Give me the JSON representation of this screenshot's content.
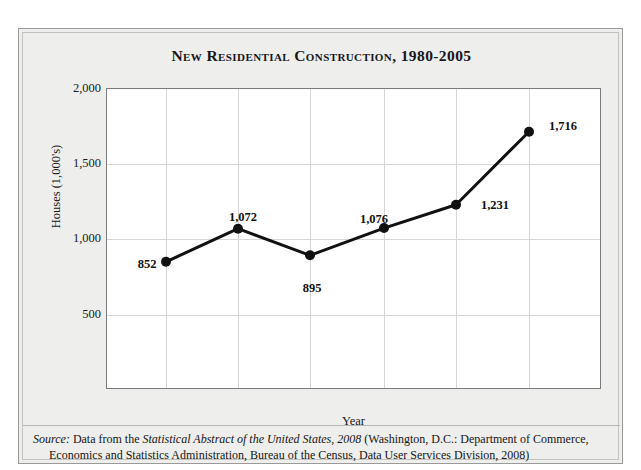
{
  "top_strip": {
    "ghost_text": "· · ·   · ·"
  },
  "figure": {
    "title": "New Residential Construction, 1980-2005",
    "source": {
      "label": "Source:",
      "text_before_italic": " Data from the ",
      "italic_work": "Statistical Abstract of the United States, 2008",
      "text_after_italic": " (Washington, D.C.: Department of Commerce,",
      "line2": "Economics and Statistics Administration, Bureau of the Census, Data User Services Division, 2008)"
    }
  },
  "chart_data": {
    "type": "line",
    "title": "New Residential Construction, 1980-2005",
    "xlabel": "Year",
    "ylabel": "Houses (1,000's)",
    "categories": [
      "1980",
      "1985",
      "1990",
      "1995",
      "2000",
      "2005"
    ],
    "values": [
      852,
      1072,
      895,
      1076,
      1231,
      1716
    ],
    "point_labels": [
      "852",
      "1,072",
      "895",
      "1,076",
      "1,231",
      "1,716"
    ],
    "label_positions": [
      "below-left",
      "above",
      "below",
      "above-left",
      "right-below",
      "above-right"
    ],
    "ylim": [
      0,
      2000
    ],
    "yticks": [
      2000,
      1500,
      1000,
      500
    ],
    "ytick_labels": [
      "2,000",
      "1,500",
      "1,000",
      "500"
    ],
    "xticks": [
      "1980",
      "1985",
      "1990",
      "1995",
      "2000",
      "2005"
    ],
    "grid": true,
    "legend": "none",
    "series_color": "#111111",
    "marker": "circle",
    "marker_size": 7,
    "line_width": 3
  },
  "style": {
    "card_background": "#eeeeec",
    "plot_background": "#ffffff",
    "grid_color": "#d6d6d6",
    "frame_color": "#7b7b7b",
    "text_color": "#161616"
  }
}
